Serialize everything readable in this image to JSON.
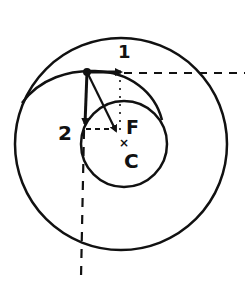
{
  "diagram": {
    "labels": {
      "arrow1": "1",
      "arrow2": "2",
      "focus": "F",
      "center": "C",
      "center_marker": "×"
    },
    "colors": {
      "ink": "#111111",
      "background": "#ffffff"
    },
    "geometry": {
      "large_circle": {
        "cx": 121,
        "cy": 144,
        "r": 106
      },
      "small_circle": {
        "cx": 124,
        "cy": 144,
        "r": 43
      },
      "point": {
        "x": 87,
        "y": 72
      },
      "arrow1_end": {
        "x": 121,
        "y": 72
      },
      "arrow2_end": {
        "x": 85,
        "y": 124
      },
      "diag_arrow_end": {
        "x": 116,
        "y": 131
      }
    }
  }
}
